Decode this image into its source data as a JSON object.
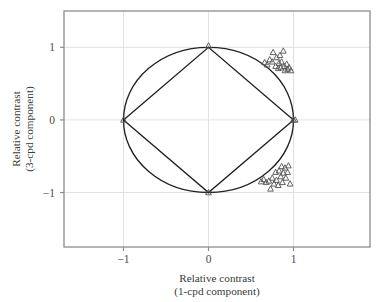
{
  "figure": {
    "background_color": "#ffffff",
    "plot_area": {
      "left": 64,
      "top": 11,
      "right": 370,
      "bottom": 247
    },
    "frame_color": "#8c8c8c",
    "grid_color": "#e2e2e2",
    "curve_color": "#222222",
    "marker_color": "#5a5a5a"
  },
  "chart_data": {
    "type": "scatter",
    "title": "",
    "xlabel": "Relative contrast\n(1-cpd component)",
    "xlabel_line1": "Relative contrast",
    "xlabel_line2": "(1-cpd component)",
    "ylabel": "Relative contrast\n(3-cpd component)",
    "ylabel_line1": "Relative contrast",
    "ylabel_line2": "(3-cpd component)",
    "xlim": [
      -1.7,
      1.9
    ],
    "ylim": [
      -1.75,
      1.5
    ],
    "xticks": [
      -1,
      0,
      1
    ],
    "xtick_labels": [
      "−1",
      "0",
      "1"
    ],
    "yticks": [
      -1,
      0,
      1
    ],
    "ytick_labels": [
      "−1",
      "0",
      "1"
    ],
    "grid": true,
    "legend": "none",
    "marker_symbol": "open-triangle",
    "annotations": [
      {
        "name": "unit-circle",
        "type": "circle",
        "center": [
          0,
          0
        ],
        "radius": 1
      },
      {
        "name": "inscribed-diamond",
        "type": "polygon",
        "vertices": [
          [
            -1,
            0
          ],
          [
            0,
            1
          ],
          [
            1,
            0
          ],
          [
            0,
            -1
          ]
        ]
      }
    ],
    "series": [
      {
        "name": "vertex-markers",
        "marker": "open-triangle",
        "points": [
          [
            0.0,
            1.02
          ],
          [
            -1.0,
            0.0
          ],
          [
            1.0,
            0.0
          ],
          [
            0.0,
            -1.0
          ]
        ]
      },
      {
        "name": "upper-right-cluster",
        "marker": "open-triangle",
        "points": [
          [
            0.66,
            0.79
          ],
          [
            0.69,
            0.76
          ],
          [
            0.72,
            0.83
          ],
          [
            0.75,
            0.8
          ],
          [
            0.76,
            0.93
          ],
          [
            0.79,
            0.74
          ],
          [
            0.8,
            0.86
          ],
          [
            0.82,
            0.71
          ],
          [
            0.83,
            0.78
          ],
          [
            0.84,
            0.89
          ],
          [
            0.85,
            0.72
          ],
          [
            0.86,
            0.8
          ],
          [
            0.88,
            0.95
          ],
          [
            0.89,
            0.74
          ],
          [
            0.9,
            0.68
          ],
          [
            0.92,
            0.77
          ],
          [
            0.93,
            0.7
          ],
          [
            0.95,
            0.72
          ],
          [
            0.97,
            0.68
          ],
          [
            1.02,
            0.0
          ]
        ]
      },
      {
        "name": "lower-right-cluster",
        "marker": "open-triangle",
        "points": [
          [
            0.62,
            -0.85
          ],
          [
            0.65,
            -0.82
          ],
          [
            0.68,
            -0.86
          ],
          [
            0.71,
            -0.84
          ],
          [
            0.73,
            -0.95
          ],
          [
            0.75,
            -0.8
          ],
          [
            0.77,
            -0.88
          ],
          [
            0.79,
            -0.72
          ],
          [
            0.8,
            -0.83
          ],
          [
            0.82,
            -0.9
          ],
          [
            0.83,
            -0.7
          ],
          [
            0.85,
            -0.78
          ],
          [
            0.86,
            -0.64
          ],
          [
            0.87,
            -0.86
          ],
          [
            0.88,
            -0.73
          ],
          [
            0.9,
            -0.66
          ],
          [
            0.91,
            -0.8
          ],
          [
            0.93,
            -0.72
          ],
          [
            0.94,
            -0.63
          ],
          [
            0.96,
            -0.88
          ]
        ]
      }
    ]
  }
}
